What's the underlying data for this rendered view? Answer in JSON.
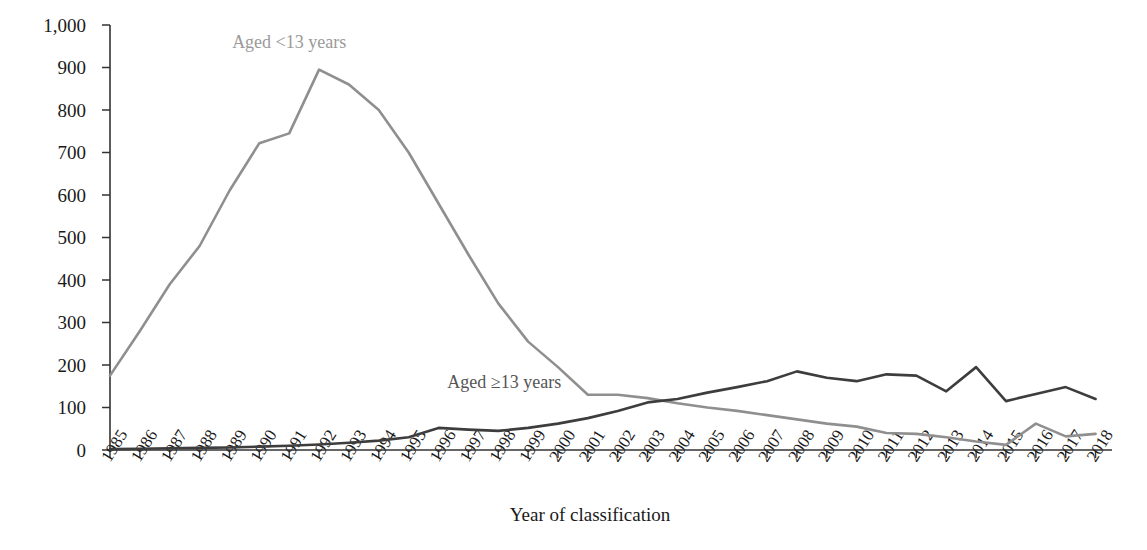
{
  "chart_data": {
    "type": "line",
    "title": "",
    "xlabel": "Year of classification",
    "ylabel": "Classifications, No.",
    "ylim": [
      0,
      1000
    ],
    "yticks": [
      "0",
      "100",
      "200",
      "300",
      "400",
      "500",
      "600",
      "700",
      "800",
      "900",
      "1,000"
    ],
    "grid": false,
    "legend_position": "inline-annotation",
    "categories": [
      "1985",
      "1986",
      "1987",
      "1988",
      "1989",
      "1990",
      "1991",
      "1992",
      "1993",
      "1994",
      "1995",
      "1996",
      "1997",
      "1998",
      "1999",
      "2000",
      "2001",
      "2002",
      "2003",
      "2004",
      "2005",
      "2006",
      "2007",
      "2008",
      "2009",
      "2010",
      "2011",
      "2012",
      "2013",
      "2014",
      "2015",
      "2016",
      "2017",
      "2018"
    ],
    "series": [
      {
        "name": "Aged <13 years",
        "color": "#8f8f8f",
        "values": [
          175,
          280,
          390,
          480,
          610,
          722,
          745,
          895,
          860,
          800,
          700,
          580,
          460,
          345,
          255,
          195,
          130,
          130,
          122,
          110,
          100,
          92,
          82,
          72,
          62,
          55,
          40,
          38,
          30,
          20,
          12,
          62,
          32,
          38
        ]
      },
      {
        "name": "Aged ≥13 years",
        "color": "#3d3d3d",
        "values": [
          2,
          3,
          4,
          5,
          6,
          8,
          10,
          13,
          17,
          22,
          30,
          52,
          48,
          45,
          52,
          62,
          75,
          92,
          112,
          120,
          135,
          148,
          162,
          185,
          170,
          162,
          178,
          175,
          138,
          195,
          115,
          132,
          148,
          120
        ]
      }
    ],
    "annotations": [
      {
        "text": "Aged <13 years",
        "x_year": 1991,
        "y_value": 945,
        "color": "#9a9a9a"
      },
      {
        "text": "Aged ≥13 years",
        "x_year": 1998.2,
        "y_value": 145,
        "color": "#555555"
      }
    ]
  },
  "axes": {
    "y_title": "Classifications, No.",
    "x_title": "Year of classification"
  }
}
